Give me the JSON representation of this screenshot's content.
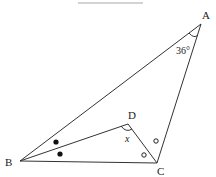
{
  "diagram": {
    "type": "geometry-triangle",
    "points": {
      "A": {
        "label": "A",
        "x": 201,
        "y": 24
      },
      "B": {
        "label": "B",
        "x": 20,
        "y": 161
      },
      "C": {
        "label": "C",
        "x": 157,
        "y": 163
      },
      "D": {
        "label": "D",
        "x": 128,
        "y": 124
      }
    },
    "angle_A": "36°",
    "angle_D": "x",
    "colors": {
      "line": "#333333",
      "header_bar": "#bbbbbb"
    }
  }
}
